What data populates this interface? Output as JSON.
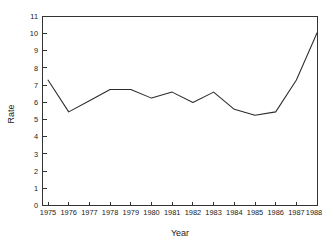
{
  "chart_data": {
    "type": "line",
    "title": "",
    "xlabel": "Year",
    "ylabel": "Rate",
    "categories": [
      1975,
      1976,
      1977,
      1978,
      1979,
      1980,
      1981,
      1982,
      1983,
      1984,
      1985,
      1986,
      1987,
      1988
    ],
    "x_tick_labels": [
      "1975",
      "1976",
      "1977",
      "1978",
      "1979",
      "1980",
      "1981",
      "1982",
      "1983",
      "1984",
      "1985",
      "1986",
      "1987",
      "1988"
    ],
    "values": [
      7.3,
      5.45,
      6.1,
      6.75,
      6.75,
      6.25,
      6.6,
      6.0,
      6.6,
      5.6,
      5.25,
      5.45,
      7.3,
      10.05
    ],
    "series": [
      {
        "name": "Rate",
        "values": [
          7.3,
          5.45,
          6.1,
          6.75,
          6.75,
          6.25,
          6.6,
          6.0,
          6.6,
          5.6,
          5.25,
          5.45,
          7.3,
          10.05
        ]
      }
    ],
    "ylim": [
      0,
      11
    ],
    "xlim": [
      1975,
      1988
    ],
    "y_ticks": [
      0,
      1,
      2,
      3,
      4,
      5,
      6,
      7,
      8,
      9,
      10,
      11
    ],
    "y_tick_labels": [
      "0",
      "1",
      "2",
      "3",
      "4",
      "5",
      "6",
      "7",
      "8",
      "9",
      "10",
      "11"
    ],
    "grid": false,
    "legend": false,
    "legend_position": "none",
    "line_color": "#2b2b2b",
    "background_color": "#ffffff",
    "axis_color": "#333333"
  }
}
